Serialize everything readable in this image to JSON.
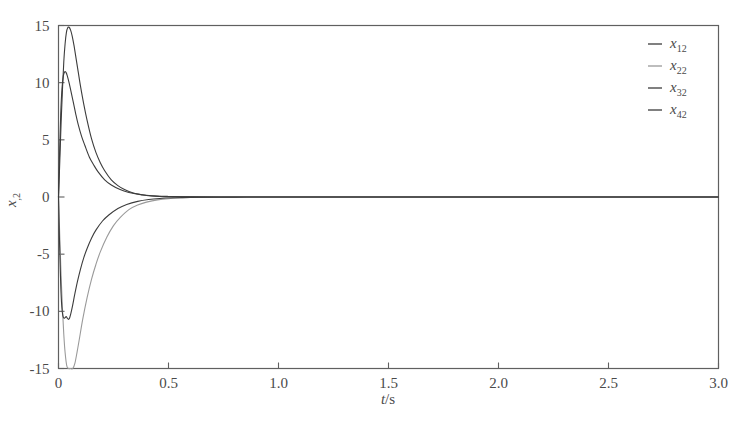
{
  "chart_data": {
    "type": "line",
    "title": "",
    "xlabel": "t/s",
    "ylabel": "x,2",
    "xlim": [
      0,
      3.0
    ],
    "ylim": [
      -15,
      15
    ],
    "grid": false,
    "legend_position": "top-right",
    "xticks": [
      "0",
      "0.5",
      "1.0",
      "1.5",
      "2.0",
      "2.5",
      "3.0"
    ],
    "xtick_values": [
      0,
      0.5,
      1.0,
      1.5,
      2.0,
      2.5,
      3.0
    ],
    "yticks": [
      "15",
      "10",
      "5",
      "0",
      "-5",
      "-10",
      "-15"
    ],
    "ytick_values": [
      15,
      10,
      5,
      0,
      -5,
      -10,
      -15
    ],
    "series": [
      {
        "name": "x12",
        "label_base": "x",
        "label_sub": "12",
        "color": "#3c3c3c",
        "x": [
          0,
          0.006,
          0.012,
          0.018,
          0.024,
          0.03,
          0.036,
          0.042,
          0.048,
          0.055,
          0.062,
          0.07,
          0.08,
          0.09,
          0.1,
          0.115,
          0.13,
          0.15,
          0.17,
          0.19,
          0.21,
          0.24,
          0.27,
          0.3,
          0.34,
          0.38,
          0.42,
          0.46,
          0.5,
          0.6,
          0.8,
          1.0,
          1.5,
          2.0,
          2.5,
          3.0
        ],
        "y": [
          0,
          3.2,
          6.6,
          9.4,
          11.8,
          13.4,
          14.4,
          14.8,
          14.85,
          14.6,
          14.1,
          13.3,
          12.1,
          10.9,
          9.7,
          8.1,
          6.7,
          5.1,
          3.9,
          3.0,
          2.3,
          1.5,
          1.0,
          0.65,
          0.35,
          0.2,
          0.1,
          0.05,
          0.03,
          0.01,
          0.0,
          0.0,
          0.0,
          0.0,
          0.0,
          0.0
        ]
      },
      {
        "name": "x22",
        "label_base": "x",
        "label_sub": "22",
        "color": "#9a9a9a",
        "x": [
          0,
          0.006,
          0.012,
          0.018,
          0.024,
          0.03,
          0.038,
          0.046,
          0.055,
          0.065,
          0.075,
          0.085,
          0.095,
          0.11,
          0.13,
          0.15,
          0.17,
          0.19,
          0.22,
          0.25,
          0.28,
          0.32,
          0.36,
          0.4,
          0.45,
          0.5,
          0.6,
          0.8,
          1.0,
          1.5,
          2.0,
          2.5,
          3.0
        ],
        "y": [
          0,
          -3.6,
          -7.0,
          -9.8,
          -12.0,
          -13.6,
          -14.8,
          -15.4,
          -15.5,
          -15.2,
          -14.5,
          -13.5,
          -12.4,
          -10.7,
          -8.8,
          -7.2,
          -5.9,
          -4.8,
          -3.5,
          -2.5,
          -1.8,
          -1.1,
          -0.7,
          -0.45,
          -0.25,
          -0.15,
          -0.05,
          -0.01,
          0.0,
          0.0,
          0.0,
          0.0,
          0.0
        ]
      },
      {
        "name": "x32",
        "label_base": "x",
        "label_sub": "32",
        "color": "#3c3c3c",
        "x": [
          0,
          0.005,
          0.01,
          0.016,
          0.022,
          0.028,
          0.034,
          0.04,
          0.048,
          0.056,
          0.066,
          0.078,
          0.09,
          0.105,
          0.12,
          0.14,
          0.16,
          0.18,
          0.21,
          0.24,
          0.28,
          0.32,
          0.36,
          0.4,
          0.45,
          0.5,
          0.6,
          0.8,
          1.0,
          1.5,
          2.0,
          2.5,
          3.0
        ],
        "y": [
          0,
          3.9,
          7.2,
          9.5,
          10.6,
          10.95,
          10.9,
          10.6,
          10.0,
          9.3,
          8.4,
          7.3,
          6.3,
          5.3,
          4.5,
          3.5,
          2.8,
          2.2,
          1.5,
          1.05,
          0.65,
          0.4,
          0.25,
          0.15,
          0.08,
          0.05,
          0.02,
          0.0,
          0.0,
          0.0,
          0.0,
          0.0,
          0.0
        ]
      },
      {
        "name": "x42",
        "label_base": "x",
        "label_sub": "42",
        "color": "#3c3c3c",
        "x": [
          0,
          0.005,
          0.01,
          0.015,
          0.02,
          0.025,
          0.03,
          0.035,
          0.04,
          0.045,
          0.05,
          0.056,
          0.064,
          0.074,
          0.086,
          0.1,
          0.115,
          0.13,
          0.15,
          0.17,
          0.2,
          0.23,
          0.27,
          0.31,
          0.36,
          0.41,
          0.46,
          0.52,
          0.6,
          0.8,
          1.0,
          1.5,
          2.0,
          2.5,
          3.0
        ],
        "y": [
          0,
          -4.2,
          -7.6,
          -9.6,
          -10.4,
          -10.6,
          -10.55,
          -10.45,
          -10.6,
          -10.7,
          -10.6,
          -10.2,
          -9.5,
          -8.5,
          -7.4,
          -6.3,
          -5.3,
          -4.5,
          -3.6,
          -2.9,
          -2.1,
          -1.55,
          -1.0,
          -0.65,
          -0.38,
          -0.22,
          -0.13,
          -0.07,
          -0.03,
          -0.01,
          0.0,
          0.0,
          0.0,
          0.0,
          0.0
        ]
      }
    ]
  },
  "legend": {
    "entries": [
      {
        "base": "x",
        "sub": "12"
      },
      {
        "base": "x",
        "sub": "22"
      },
      {
        "base": "x",
        "sub": "32"
      },
      {
        "base": "x",
        "sub": "42"
      }
    ]
  },
  "axis_labels": {
    "x_italic": "t",
    "x_unit": "/s",
    "y_italic": "x",
    "y_sub": ",2"
  }
}
